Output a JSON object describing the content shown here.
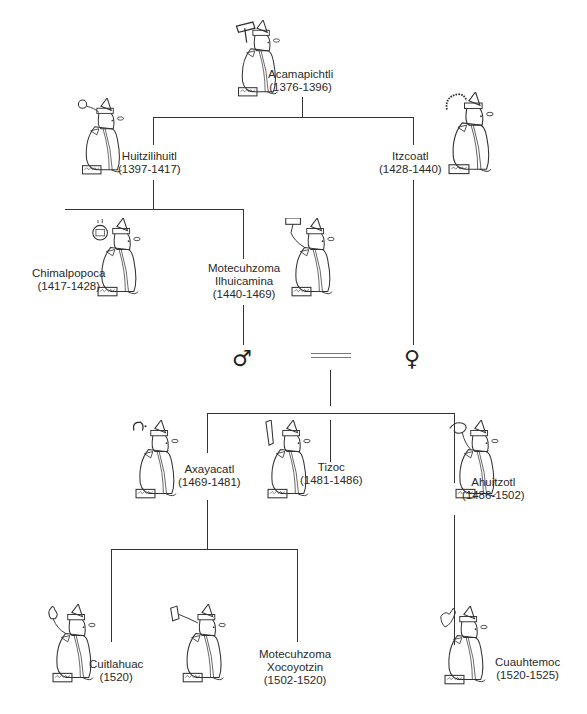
{
  "diagram": {
    "type": "genealogy-tree",
    "rulers": [
      {
        "id": "acamapichtli",
        "name": "Acamapichtli",
        "years": "(1376-1396)"
      },
      {
        "id": "huitzilihuitl",
        "name": "Huitzilihuitl",
        "years": "(1397-1417)"
      },
      {
        "id": "itzcoatl",
        "name": "Itzcoatl",
        "years": "(1428-1440)"
      },
      {
        "id": "chimalpopoca",
        "name": "Chimalpopoca",
        "years": "(1417-1428)"
      },
      {
        "id": "motecuhzoma-ilhuicamina",
        "name_line1": "Motecuhzoma",
        "name_line2": "Ilhuicamina",
        "years": "(1440-1469)"
      },
      {
        "id": "axayacatl",
        "name": "Axayacatl",
        "years": "(1469-1481)"
      },
      {
        "id": "tizoc",
        "name": "Tizoc",
        "years": "(1481-1486)"
      },
      {
        "id": "ahuitzotl",
        "name": "Ahuitzotl",
        "years": "(1486-1502)"
      },
      {
        "id": "cuitlahuac",
        "name": "Cuitlahuac",
        "years": "(1520)"
      },
      {
        "id": "motecuhzoma-xocoyotzin",
        "name_line1": "Motecuhzoma",
        "name_line2": "Xocoyotzin",
        "years": "(1502-1520)"
      },
      {
        "id": "cuauhtemoc",
        "name": "Cuauhtemoc",
        "years": "(1520-1525)"
      }
    ],
    "symbols": {
      "male": "♂",
      "female": "♀"
    },
    "colors": {
      "line": "#333333",
      "text": "#2a2a2a",
      "background": "#ffffff"
    }
  }
}
